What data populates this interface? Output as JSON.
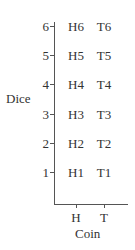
{
  "diagram": {
    "y_axis_label": "Dice",
    "x_axis_label": "Coin",
    "y_ticks": [
      "1",
      "2",
      "3",
      "4",
      "5",
      "6"
    ],
    "x_ticks": [
      "H",
      "T"
    ],
    "cells": {
      "H": [
        "H1",
        "H2",
        "H3",
        "H4",
        "H5",
        "H6"
      ],
      "T": [
        "T1",
        "T2",
        "T3",
        "T4",
        "T5",
        "T6"
      ]
    }
  }
}
